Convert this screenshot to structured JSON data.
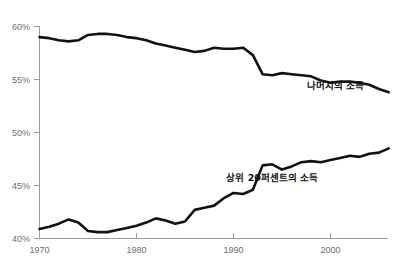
{
  "chart_data": {
    "type": "line",
    "title": "",
    "subtitle": "",
    "xlabel": "",
    "ylabel": "",
    "xlim": [
      1970,
      2006
    ],
    "ylim": [
      40,
      60
    ],
    "grid": false,
    "legend_position": "inline-annotation",
    "x_tick_labels": [
      "1970",
      "1980",
      "1990",
      "2000"
    ],
    "x_ticks": [
      1970,
      1980,
      1990,
      2000
    ],
    "y_tick_labels": [
      "60%",
      "55%",
      "50%",
      "45%",
      "40%"
    ],
    "y_ticks": [
      60,
      55,
      50,
      45,
      40
    ],
    "x": [
      1970,
      1971,
      1972,
      1973,
      1974,
      1975,
      1976,
      1977,
      1978,
      1979,
      1980,
      1981,
      1982,
      1983,
      1984,
      1985,
      1986,
      1987,
      1988,
      1989,
      1990,
      1991,
      1992,
      1993,
      1994,
      1995,
      1996,
      1997,
      1998,
      1999,
      2000,
      2001,
      2002,
      2003,
      2004,
      2005,
      2006
    ],
    "series": [
      {
        "name": "나머지의 소득",
        "label_x": 2000.5,
        "label_y": 54.1,
        "color": "#111111",
        "values": [
          59.0,
          58.9,
          58.7,
          58.6,
          58.7,
          59.2,
          59.3,
          59.3,
          59.2,
          59.0,
          58.9,
          58.7,
          58.4,
          58.2,
          58.0,
          57.8,
          57.6,
          57.7,
          58.0,
          57.9,
          57.9,
          58.0,
          57.3,
          55.5,
          55.4,
          55.6,
          55.5,
          55.4,
          55.3,
          54.9,
          54.7,
          54.8,
          54.8,
          54.7,
          54.5,
          54.1,
          53.8
        ]
      },
      {
        "name": "상위 20퍼센트의 소득",
        "label_x": 1994.0,
        "label_y": 45.4,
        "color": "#111111",
        "values": [
          40.9,
          41.1,
          41.4,
          41.8,
          41.5,
          40.7,
          40.6,
          40.6,
          40.8,
          41.0,
          41.2,
          41.5,
          41.9,
          41.7,
          41.4,
          41.6,
          42.7,
          42.9,
          43.1,
          43.8,
          44.3,
          44.2,
          44.6,
          46.9,
          47.0,
          46.5,
          46.8,
          47.2,
          47.3,
          47.2,
          47.4,
          47.6,
          47.8,
          47.7,
          48.0,
          48.1,
          48.5
        ]
      }
    ],
    "annotations": []
  },
  "axes": {
    "y_axis_name": "percent-axis",
    "x_axis_name": "year-axis"
  },
  "colors": {
    "line": "#111111",
    "axis": "#9b9b9b",
    "tick_text": "#6d6d6d",
    "label_text": "#111111",
    "background": "#ffffff"
  }
}
